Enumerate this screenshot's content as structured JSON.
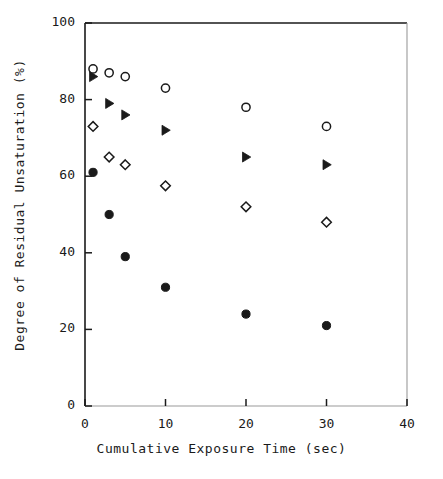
{
  "chart_data": {
    "type": "scatter",
    "title": "",
    "xlabel": "Cumulative Exposure Time (sec)",
    "ylabel": "Degree of Residual Unsaturation  (%)",
    "xlim": [
      0,
      40
    ],
    "ylim": [
      0,
      100
    ],
    "xticks": [
      0,
      10,
      20,
      30,
      40
    ],
    "yticks": [
      0,
      20,
      40,
      60,
      80,
      100
    ],
    "xtick_labels": [
      "0",
      "10",
      "20",
      "30",
      "40"
    ],
    "ytick_labels": [
      "0",
      "20",
      "40",
      "60",
      "80",
      "100"
    ],
    "grid": false,
    "legend": "none",
    "x": [
      1,
      3,
      5,
      10,
      20,
      30
    ],
    "series": [
      {
        "name": "open-circle",
        "marker": "open-circle",
        "color": "#1a1a1a",
        "values": [
          88,
          87,
          86,
          83,
          78,
          73
        ],
        "x": [
          1,
          3,
          5,
          10,
          20,
          30
        ]
      },
      {
        "name": "filled-triangle",
        "marker": "filled-right-triangle",
        "color": "#1a1a1a",
        "values": [
          86,
          79,
          76,
          72,
          65,
          63
        ],
        "x": [
          1,
          3,
          5,
          10,
          20,
          30
        ]
      },
      {
        "name": "open-diamond",
        "marker": "open-diamond",
        "color": "#1a1a1a",
        "values": [
          73,
          65,
          63,
          57.5,
          52,
          48
        ],
        "x": [
          1,
          3,
          5,
          10,
          20,
          30
        ]
      },
      {
        "name": "filled-circle",
        "marker": "filled-circle",
        "color": "#1a1a1a",
        "values": [
          61,
          50,
          39,
          31,
          24,
          21
        ],
        "x": [
          1,
          3,
          5,
          10,
          20,
          30
        ]
      }
    ]
  },
  "axes": {
    "frame_color": "#1a1a1a",
    "marker_color": "#1a1a1a"
  }
}
